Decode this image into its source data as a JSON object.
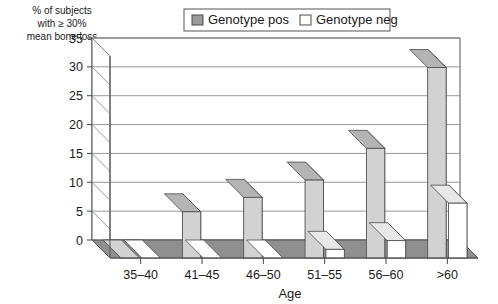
{
  "chart_data": {
    "type": "bar",
    "title": "",
    "subtitle": "",
    "xlabel": "Age",
    "ylabel": "% of subjects with ≥ 30% mean bone loss",
    "ylabel_lines": [
      "% of subjects",
      "with ≥ 30%",
      "mean bone loss"
    ],
    "categories": [
      "35–40",
      "41–45",
      "46–50",
      "51–55",
      "56–60",
      ">60"
    ],
    "series": [
      {
        "name": "Genotype pos",
        "values": [
          0,
          8,
          10.5,
          13.5,
          19,
          33
        ],
        "color": "#d2d2d2"
      },
      {
        "name": "Genotype neg",
        "values": [
          0,
          0,
          0,
          1.5,
          3,
          9.5
        ],
        "color": "#ffffff"
      }
    ],
    "ylim": [
      0,
      35
    ],
    "yticks": [
      0,
      5,
      10,
      15,
      20,
      25,
      30,
      35
    ],
    "ytick_labels": [
      "0",
      "5",
      "10",
      "15",
      "20",
      "25",
      "30",
      "35"
    ],
    "grid": true,
    "grid_axis": "y",
    "legend_position": "top-center",
    "style": "3d-column"
  },
  "legend": {
    "items": [
      {
        "label": "Genotype pos",
        "swatch": "filled-gray-swatch"
      },
      {
        "label": "Genotype neg",
        "swatch": "empty-white-swatch"
      }
    ]
  },
  "colors": {
    "bar_pos_front": "#d2d2d2",
    "bar_pos_side": "#8f8f8f",
    "bar_pos_top": "#b4b4b4",
    "bar_neg_front": "#ffffff",
    "bar_neg_side": "#9a9a9a",
    "bar_neg_top": "#e8e8e8",
    "floor": "#8f8f8f",
    "grid": "#8c8c8c",
    "frame": "#555555",
    "text": "#1a1a1a"
  },
  "axis": {
    "x_title": "Age",
    "y_title_line1": "% of subjects",
    "y_title_line2": "with ≥ 30%",
    "y_title_line3": "mean bone loss"
  }
}
